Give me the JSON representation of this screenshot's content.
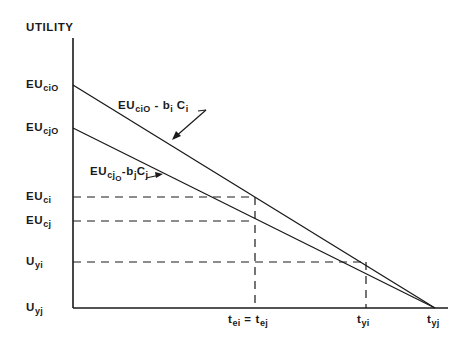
{
  "diagram": {
    "y_axis_title": "UTILITY",
    "y_labels": [
      {
        "id": "eucio",
        "main": "EU",
        "sub": "ciO",
        "y": 79
      },
      {
        "id": "eucjo",
        "main": "EU",
        "sub": "cjO",
        "y": 122
      },
      {
        "id": "euci",
        "main": "EU",
        "sub": "ci",
        "y": 191
      },
      {
        "id": "eucj",
        "main": "EU",
        "sub": "cj",
        "y": 215
      },
      {
        "id": "uyi",
        "main": "U",
        "sub": "yi",
        "y": 256
      },
      {
        "id": "uyj",
        "main": "U",
        "sub": "yj",
        "y": 302
      }
    ],
    "x_labels": [
      {
        "id": "tei-tej",
        "text": "t_ei = t_ej",
        "a_main": "t",
        "a_sub": "ei",
        "eq": " = ",
        "b_main": "t",
        "b_sub": "ej",
        "x": 228
      },
      {
        "id": "tyi",
        "main": "t",
        "sub": "yi",
        "x": 357
      },
      {
        "id": "tyj",
        "main": "t",
        "sub": "yj",
        "x": 427
      }
    ],
    "line_labels": {
      "upper": {
        "main": "EU",
        "sub": "ciO",
        "minus": " - ",
        "b": "b",
        "b_sub": "i",
        "c": " C",
        "c_sub": "i"
      },
      "lower": {
        "main": "EU",
        "sub": "cj",
        "subsub": "O",
        "minus": "-",
        "b": "b",
        "b_sub": "j",
        "c": "C",
        "c_sub": "j"
      }
    },
    "geometry": {
      "axis_x": 73,
      "baseline_y": 308,
      "axis_top_y": 38,
      "baseline_end_x": 448,
      "convergence_x": 435,
      "upper_line_start_y": 85,
      "lower_line_start_y": 128,
      "dashed_levels_y": {
        "euci": 197,
        "eucj": 221,
        "uyi": 262
      },
      "dashed_vertical_x": {
        "tei": 255,
        "tyi": 366
      }
    },
    "colors": {
      "ink": "#1a1a1a",
      "background": "#ffffff"
    }
  }
}
